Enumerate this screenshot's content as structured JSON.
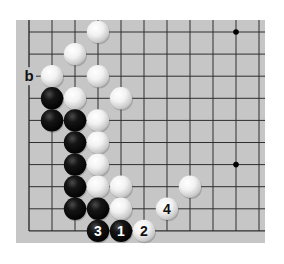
{
  "diagram": {
    "type": "go-board-fragment",
    "board": {
      "background": "#c6c6c6",
      "line_color": "#2e2e2e",
      "edges_shown": [
        "left",
        "bottom"
      ],
      "columns": 11,
      "rows": 10,
      "origin_px": [
        29,
        32
      ],
      "spacing_px": [
        23,
        22.1
      ],
      "rect_px": {
        "x": 16,
        "y": 20,
        "w": 249,
        "h": 223
      },
      "star_points": [
        [
          9,
          0
        ],
        [
          9,
          6
        ]
      ]
    },
    "stones": [
      {
        "color": "white",
        "col": 3,
        "row": 0
      },
      {
        "color": "white",
        "col": 2,
        "row": 1
      },
      {
        "color": "white",
        "col": 1,
        "row": 2
      },
      {
        "color": "white",
        "col": 3,
        "row": 2
      },
      {
        "color": "black",
        "col": 1,
        "row": 3
      },
      {
        "color": "white",
        "col": 2,
        "row": 3
      },
      {
        "color": "white",
        "col": 4,
        "row": 3
      },
      {
        "color": "black",
        "col": 1,
        "row": 4
      },
      {
        "color": "black",
        "col": 2,
        "row": 4
      },
      {
        "color": "white",
        "col": 3,
        "row": 4
      },
      {
        "color": "black",
        "col": 2,
        "row": 5
      },
      {
        "color": "white",
        "col": 3,
        "row": 5
      },
      {
        "color": "black",
        "col": 2,
        "row": 6
      },
      {
        "color": "white",
        "col": 3,
        "row": 6
      },
      {
        "color": "black",
        "col": 2,
        "row": 7
      },
      {
        "color": "white",
        "col": 3,
        "row": 7
      },
      {
        "color": "white",
        "col": 4,
        "row": 7
      },
      {
        "color": "white",
        "col": 7,
        "row": 7
      },
      {
        "color": "black",
        "col": 2,
        "row": 8
      },
      {
        "color": "black",
        "col": 3,
        "row": 8
      },
      {
        "color": "white",
        "col": 4,
        "row": 8
      },
      {
        "color": "white",
        "col": 6,
        "row": 8,
        "label": "4"
      },
      {
        "color": "black",
        "col": 3,
        "row": 9,
        "label": "3"
      },
      {
        "color": "black",
        "col": 4,
        "row": 9,
        "label": "1"
      },
      {
        "color": "white",
        "col": 5,
        "row": 9,
        "label": "2"
      }
    ],
    "point_labels": [
      {
        "col": 0,
        "row": 2,
        "text": "b"
      }
    ]
  }
}
